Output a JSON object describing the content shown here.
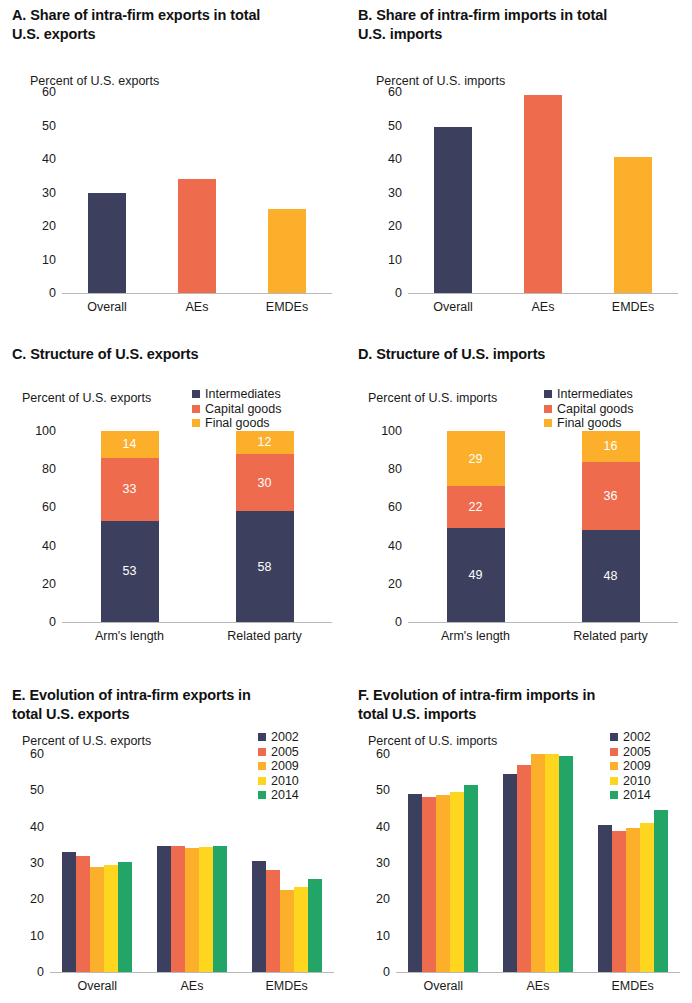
{
  "colors": {
    "navy": "#3d3f5e",
    "coral": "#ef6b4d",
    "amber": "#fbaf2b",
    "yellow": "#ffd61f",
    "green": "#23a568",
    "axis": "#b9b9b9",
    "text": "#1a1a1a"
  },
  "panels": {
    "A": {
      "title": "A. Share of intra-firm exports in total\nU.S. exports",
      "axis_note": "Percent of U.S. exports"
    },
    "B": {
      "title": "B. Share of intra-firm imports in total\nU.S. imports",
      "axis_note": "Percent of U.S. imports"
    },
    "C": {
      "title": "C. Structure of U.S. exports",
      "axis_note": "Percent of U.S. exports"
    },
    "D": {
      "title": "D. Structure of U.S. imports",
      "axis_note": "Percent of U.S. imports"
    },
    "E": {
      "title": "E. Evolution of intra-firm exports in\ntotal U.S. exports",
      "axis_note": "Percent of U.S. exports"
    },
    "F": {
      "title": "F. Evolution of intra-firm imports in\ntotal U.S. imports",
      "axis_note": "Percent of U.S. imports"
    }
  },
  "chart_data": [
    {
      "panel": "A",
      "type": "bar",
      "title": "A. Share of intra-firm exports in total U.S. exports",
      "ylabel": "Percent of U.S. exports",
      "xlabel": "",
      "categories": [
        "Overall",
        "AEs",
        "EMDEs"
      ],
      "values": [
        30,
        34,
        25
      ],
      "bar_colors": [
        "#3d3f5e",
        "#ef6b4d",
        "#fbaf2b"
      ],
      "ylim": [
        0,
        60
      ],
      "yticks": [
        0,
        10,
        20,
        30,
        40,
        50,
        60
      ],
      "grid": false,
      "legend": null
    },
    {
      "panel": "B",
      "type": "bar",
      "title": "B. Share of intra-firm imports in total U.S. imports",
      "ylabel": "Percent of U.S. imports",
      "xlabel": "",
      "categories": [
        "Overall",
        "AEs",
        "EMDEs"
      ],
      "values": [
        49.5,
        59,
        40.5
      ],
      "bar_colors": [
        "#3d3f5e",
        "#ef6b4d",
        "#fbaf2b"
      ],
      "ylim": [
        0,
        60
      ],
      "yticks": [
        0,
        10,
        20,
        30,
        40,
        50,
        60
      ],
      "grid": false,
      "legend": null
    },
    {
      "panel": "C",
      "type": "bar",
      "stacked": true,
      "title": "C. Structure of U.S. exports",
      "ylabel": "Percent of U.S. exports",
      "xlabel": "",
      "categories": [
        "Arm's length",
        "Related party"
      ],
      "series": [
        {
          "name": "Intermediates",
          "color": "#3d3f5e",
          "values": [
            53,
            58
          ]
        },
        {
          "name": "Capital goods",
          "color": "#ef6b4d",
          "values": [
            33,
            30
          ]
        },
        {
          "name": "Final goods",
          "color": "#fbaf2b",
          "values": [
            14,
            12
          ]
        }
      ],
      "ylim": [
        0,
        100
      ],
      "yticks": [
        0,
        20,
        40,
        60,
        80,
        100
      ],
      "grid": false,
      "legend_position": "top-right",
      "data_labels": true
    },
    {
      "panel": "D",
      "type": "bar",
      "stacked": true,
      "title": "D. Structure of U.S. imports",
      "ylabel": "Percent of U.S. imports",
      "xlabel": "",
      "categories": [
        "Arm's length",
        "Related party"
      ],
      "series": [
        {
          "name": "Intermediates",
          "color": "#3d3f5e",
          "values": [
            49,
            48
          ]
        },
        {
          "name": "Capital goods",
          "color": "#ef6b4d",
          "values": [
            22,
            36
          ]
        },
        {
          "name": "Final goods",
          "color": "#fbaf2b",
          "values": [
            29,
            16
          ]
        }
      ],
      "ylim": [
        0,
        100
      ],
      "yticks": [
        0,
        20,
        40,
        60,
        80,
        100
      ],
      "grid": false,
      "legend_position": "top-right",
      "data_labels": true
    },
    {
      "panel": "E",
      "type": "bar",
      "grouped": true,
      "title": "E. Evolution of intra-firm exports in total U.S. exports",
      "ylabel": "Percent of U.S. exports",
      "xlabel": "",
      "categories": [
        "Overall",
        "AEs",
        "EMDEs"
      ],
      "series": [
        {
          "name": "2002",
          "color": "#3d3f5e",
          "values": [
            33,
            34.7,
            30.5
          ]
        },
        {
          "name": "2005",
          "color": "#ef6b4d",
          "values": [
            32,
            34.7,
            28
          ]
        },
        {
          "name": "2009",
          "color": "#fbaf2b",
          "values": [
            29,
            34.2,
            22.5
          ]
        },
        {
          "name": "2010",
          "color": "#ffd61f",
          "values": [
            29.5,
            34.3,
            23.5
          ]
        },
        {
          "name": "2014",
          "color": "#23a568",
          "values": [
            30.2,
            34.7,
            25.5
          ]
        }
      ],
      "ylim": [
        0,
        60
      ],
      "yticks": [
        0,
        10,
        20,
        30,
        40,
        50,
        60
      ],
      "grid": false,
      "legend_position": "top-right"
    },
    {
      "panel": "F",
      "type": "bar",
      "grouped": true,
      "title": "F. Evolution of intra-firm imports in total U.S. imports",
      "ylabel": "Percent of U.S. imports",
      "xlabel": "",
      "categories": [
        "Overall",
        "AEs",
        "EMDEs"
      ],
      "series": [
        {
          "name": "2002",
          "color": "#3d3f5e",
          "values": [
            49,
            54.5,
            40.5
          ]
        },
        {
          "name": "2005",
          "color": "#ef6b4d",
          "values": [
            48.3,
            57,
            38.8
          ]
        },
        {
          "name": "2009",
          "color": "#fbaf2b",
          "values": [
            48.7,
            60,
            39.5
          ]
        },
        {
          "name": "2010",
          "color": "#ffd61f",
          "values": [
            49.5,
            60,
            41
          ]
        },
        {
          "name": "2014",
          "color": "#23a568",
          "values": [
            51.5,
            59.5,
            44.5
          ]
        }
      ],
      "ylim": [
        0,
        60
      ],
      "yticks": [
        0,
        10,
        20,
        30,
        40,
        50,
        60
      ],
      "grid": false,
      "legend_position": "top-right"
    }
  ]
}
